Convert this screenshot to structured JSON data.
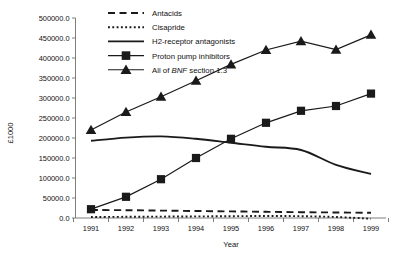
{
  "chart_data": {
    "type": "line",
    "title": "",
    "xlabel": "Year",
    "ylabel": "£1000",
    "categories": [
      "1991",
      "1992",
      "1993",
      "1994",
      "1995",
      "1996",
      "1997",
      "1998",
      "1999"
    ],
    "x": [
      1991,
      1992,
      1993,
      1994,
      1995,
      1996,
      1997,
      1998,
      1999
    ],
    "xlim": [
      1991,
      1999
    ],
    "ylim": [
      0,
      500000
    ],
    "ytick_labels": [
      "0.0",
      "50000.0",
      "100000.0",
      "150000.0",
      "200000.0",
      "250000.0",
      "300000.0",
      "350000.0",
      "400000.0",
      "450000.0",
      "500000.0"
    ],
    "ytick_values": [
      0,
      50000,
      100000,
      150000,
      200000,
      250000,
      300000,
      350000,
      400000,
      450000,
      500000
    ],
    "xtick_labels": [
      "1991",
      "1992",
      "1993",
      "1994",
      "1995",
      "1996",
      "1997",
      "1998",
      "1999"
    ],
    "grid": false,
    "legend_position": "top-center",
    "series": [
      {
        "name": "Antacids",
        "style": "dashed",
        "marker": "none",
        "color": "#1a1a1a",
        "values": [
          20000,
          19500,
          18500,
          17500,
          16500,
          15500,
          14500,
          13800,
          13000
        ]
      },
      {
        "name": "Cisapride",
        "style": "dotted",
        "marker": "none",
        "color": "#1a1a1a",
        "values": [
          2500,
          3000,
          3500,
          4000,
          4500,
          5000,
          4500,
          2500,
          -2000
        ]
      },
      {
        "name": "H2-receptor antagonists",
        "style": "solid",
        "marker": "none",
        "color": "#1a1a1a",
        "values": [
          193000,
          201000,
          204000,
          198000,
          188000,
          178000,
          170000,
          133000,
          110000
        ]
      },
      {
        "name": "Proton pump inhibitors",
        "style": "solid",
        "marker": "square",
        "color": "#1a1a1a",
        "values": [
          22000,
          53000,
          97000,
          150000,
          198000,
          238000,
          268000,
          280000,
          311000
        ]
      },
      {
        "name": "All of BNF section 1.3",
        "style": "solid",
        "marker": "triangle",
        "color": "#1a1a1a",
        "values": [
          220000,
          265000,
          303000,
          343000,
          384000,
          420000,
          442000,
          421000,
          458000
        ],
        "name_parts": {
          "prefix": "All of ",
          "emphasis": "BNF",
          "suffix": " section 1.3"
        }
      }
    ]
  },
  "legend": {
    "items": [
      {
        "label": "Antacids",
        "icon": "dashed-line-swatch"
      },
      {
        "label": "Cisapride",
        "icon": "dotted-line-swatch"
      },
      {
        "label": "H2-receptor antagonists",
        "icon": "solid-line-swatch"
      },
      {
        "label": "Proton pump inhibitors",
        "icon": "square-marker-swatch"
      },
      {
        "label": "All of BNF section 1.3",
        "icon": "triangle-marker-swatch"
      }
    ]
  }
}
